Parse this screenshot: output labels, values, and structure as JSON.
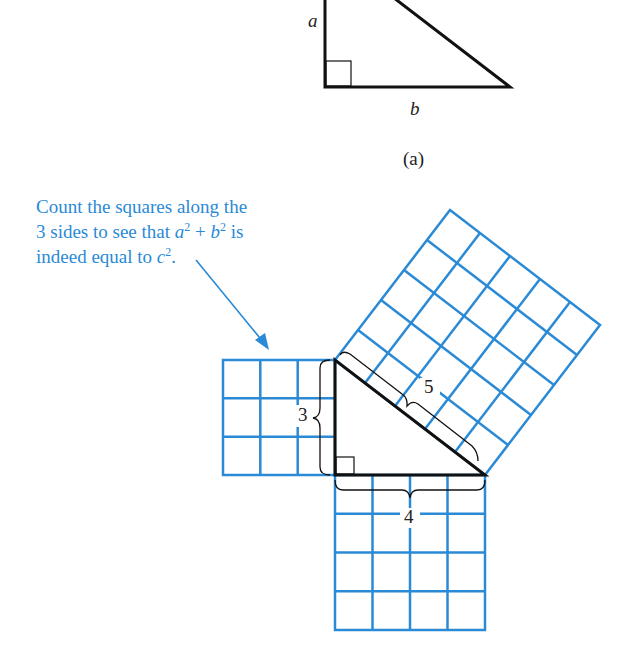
{
  "figure_a": {
    "label_a": "a",
    "label_b": "b",
    "label_c": "c",
    "caption": "(a)"
  },
  "figure_b": {
    "annotation": {
      "line1": "Count the squares along the",
      "line2_pre": "3 sides to see that ",
      "a": "a",
      "b": "b",
      "plus": " + ",
      "sup": "2",
      "line2_post": " is",
      "line3_pre": "indeed equal to ",
      "c": "c",
      "line3_post": "."
    },
    "side_labels": {
      "left": "3",
      "bottom": "4",
      "hypotenuse": "5"
    }
  },
  "colors": {
    "grid": "#2a8ad6",
    "line": "#111111",
    "text_accent": "#2a8ad6"
  }
}
